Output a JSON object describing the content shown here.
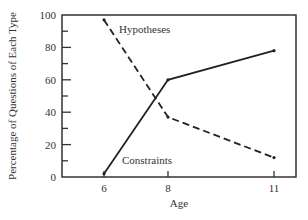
{
  "chart_data": {
    "type": "line",
    "title": "",
    "xlabel": "Age",
    "ylabel": "Percentage of Questions of Each Type",
    "x": [
      6,
      8,
      11
    ],
    "x_ticks": [
      "6",
      "8",
      "11"
    ],
    "y_ticks": [
      "0",
      "20",
      "40",
      "60",
      "80",
      "100"
    ],
    "ylim": [
      0,
      100
    ],
    "grid": false,
    "legend": "inline labels",
    "series": [
      {
        "name": "Hypotheses",
        "style": "dashed",
        "values": [
          97,
          37,
          12
        ]
      },
      {
        "name": "Constraints",
        "style": "solid",
        "values": [
          2,
          60,
          78
        ]
      }
    ]
  },
  "colors": {
    "line": "#222222",
    "axis": "#333333",
    "background": "#ffffff"
  }
}
